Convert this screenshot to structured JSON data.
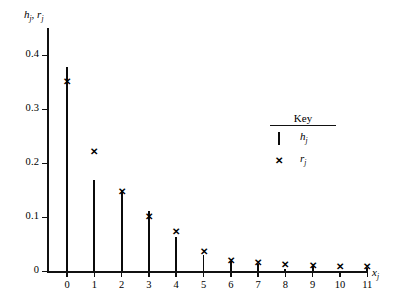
{
  "chart_data": {
    "type": "bar",
    "title": "",
    "xlabel": "x_j",
    "ylabel": "h_j, r_j",
    "categories": [
      "0",
      "1",
      "2",
      "3",
      "4",
      "5",
      "6",
      "7",
      "8",
      "9",
      "10",
      "11"
    ],
    "x": [
      0,
      1,
      2,
      3,
      4,
      5,
      6,
      7,
      8,
      9,
      10,
      11
    ],
    "series": [
      {
        "name": "h_j",
        "marker": "bar",
        "values": [
          0.378,
          0.17,
          0.148,
          0.111,
          0.063,
          0.031,
          0.019,
          0.013,
          0.005,
          0.01,
          0.0,
          0.007
        ]
      },
      {
        "name": "r_j",
        "marker": "cross",
        "values": [
          0.352,
          0.222,
          0.148,
          0.102,
          0.074,
          0.037,
          0.02,
          0.017,
          0.013,
          0.011,
          0.009,
          0.009
        ]
      }
    ],
    "xlim": [
      -0.6,
      12.0
    ],
    "ylim": [
      0,
      0.43
    ],
    "yticks": [
      0,
      0.1,
      0.2,
      0.3,
      0.4
    ],
    "ytick_labels": [
      "0",
      "0.1",
      "0.2",
      "0.3",
      "0.4"
    ],
    "xtick_labels": [
      "0",
      "1",
      "2",
      "3",
      "4",
      "5",
      "6",
      "7",
      "8",
      "9",
      "10",
      "11"
    ],
    "grid": false,
    "legend_position": "upper-right-inside",
    "axis_color": "#111111",
    "bar_color": "#0b0b0b",
    "marker_color": "#000000"
  },
  "axis_titles": {
    "y_main": "h",
    "y_sub1": "j",
    "y_mid": ", ",
    "y_main2": "r",
    "y_sub2": "j",
    "x_main": "x",
    "x_sub": "j"
  },
  "key": {
    "title": "Key",
    "rows": [
      {
        "symbol": "vertical-bar",
        "label_main": "h",
        "label_sub": "j"
      },
      {
        "symbol": "cross",
        "symbol_glyph": "✕",
        "label_main": "r",
        "label_sub": "j"
      }
    ]
  },
  "ytick_labels": [
    "0.4",
    "0.3",
    "0.2",
    "0.1",
    "0"
  ],
  "xtick_labels": [
    "0",
    "1",
    "2",
    "3",
    "4",
    "5",
    "6",
    "7",
    "8",
    "9",
    "10",
    "11"
  ],
  "marker_glyph": "✕"
}
